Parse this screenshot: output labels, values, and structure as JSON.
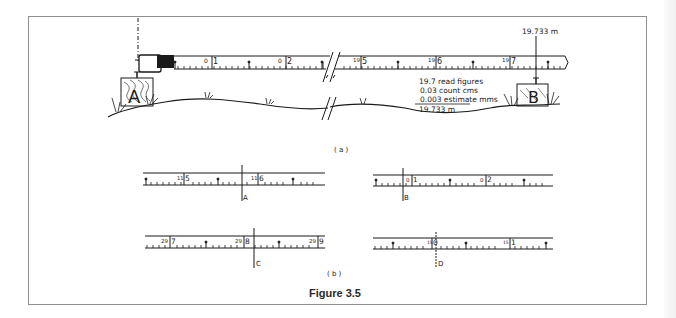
{
  "figure": {
    "caption": "Figure 3.5",
    "part_a_label": "( a )",
    "part_b_label": "( b )"
  },
  "part_a": {
    "peg_a_label": "A",
    "peg_b_label": "B",
    "reading_label": "19.733 m",
    "tape_labels_start": [
      "0",
      "1",
      "0",
      "2"
    ],
    "tape_labels_end": [
      "19",
      "5",
      "19",
      "6",
      "19",
      "7"
    ],
    "calculation": {
      "line1": "19.7 read  figures",
      "line2": "0.03 count  cms",
      "line3": "0.003  estimate  mms",
      "total": "19.733 m"
    }
  },
  "part_b": {
    "readings": [
      {
        "id": "A",
        "left_major": "11",
        "left_minor": "5",
        "right_major": "11",
        "right_minor": "6"
      },
      {
        "id": "B",
        "left_major": "0",
        "left_minor": "1",
        "right_major": "0",
        "right_minor": "2"
      },
      {
        "id": "C",
        "left_major": "29",
        "left_minor": "7",
        "mid_major": "29",
        "mid_minor": "8",
        "right_major": "29",
        "right_minor": "9"
      },
      {
        "id": "D",
        "left_major": "15",
        "left_minor": "0",
        "right_major": "15",
        "right_minor": "1"
      }
    ]
  },
  "colors": {
    "ink": "#1a1a1a",
    "frame": "#8f8f8f",
    "background": "#ffffff"
  }
}
